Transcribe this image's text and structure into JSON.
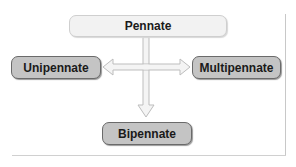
{
  "diagram": {
    "root": {
      "label": "Pennate"
    },
    "children": [
      {
        "label": "Unipennate",
        "direction": "left"
      },
      {
        "label": "Multipennate",
        "direction": "right"
      },
      {
        "label": "Bipennate",
        "direction": "down"
      }
    ]
  },
  "colors": {
    "root_fill": "#f2f2f2",
    "child_fill": "#c4c4c4",
    "child_border": "#6a6a6a",
    "arrow_fill": "#f4f4f4",
    "arrow_stroke": "#bdbdbd"
  }
}
